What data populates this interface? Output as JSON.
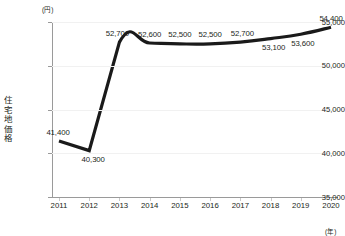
{
  "chart_data": {
    "type": "line",
    "title": "",
    "subtitle": "",
    "xlabel": "(年)",
    "ylabel": "住宅地価格",
    "y_unit": "(円)",
    "categories": [
      "2011",
      "2012",
      "2013",
      "2014",
      "2015",
      "2016",
      "2017",
      "2018",
      "2019",
      "2020"
    ],
    "values": [
      41400,
      40300,
      52700,
      52600,
      52500,
      52500,
      52700,
      53100,
      53600,
      54400
    ],
    "value_labels": [
      "41,400",
      "40,300",
      "52,700",
      "52,600",
      "52,500",
      "52,500",
      "52,700",
      "53,100",
      "53,600",
      "54,400"
    ],
    "label_positions": [
      "above",
      "below",
      "above",
      "above",
      "above",
      "above",
      "above",
      "below",
      "below",
      "above"
    ],
    "ylim": [
      35000,
      55000
    ],
    "ytick_values": [
      35000,
      40000,
      45000,
      50000,
      55000
    ],
    "ytick_labels": [
      "35,000",
      "40,000",
      "45,000",
      "50,000",
      "55,000"
    ],
    "grid": true,
    "grid_axis": "y",
    "legend": "none",
    "series": [
      {
        "name": "住宅地価格",
        "values": [
          41400,
          40300,
          52700,
          52600,
          52500,
          52500,
          52700,
          53100,
          53600,
          54400
        ],
        "color": "#1a1a1a",
        "line_width": 3.2,
        "markers": false
      }
    ],
    "colors": {
      "line": "#1a1a1a",
      "grid": "#f1f1f1",
      "axis": "#9a9a9a",
      "text": "#231f20",
      "background": "#ffffff"
    }
  },
  "axis_title_chars": [
    "住",
    "宅",
    "地",
    "価",
    "格"
  ]
}
